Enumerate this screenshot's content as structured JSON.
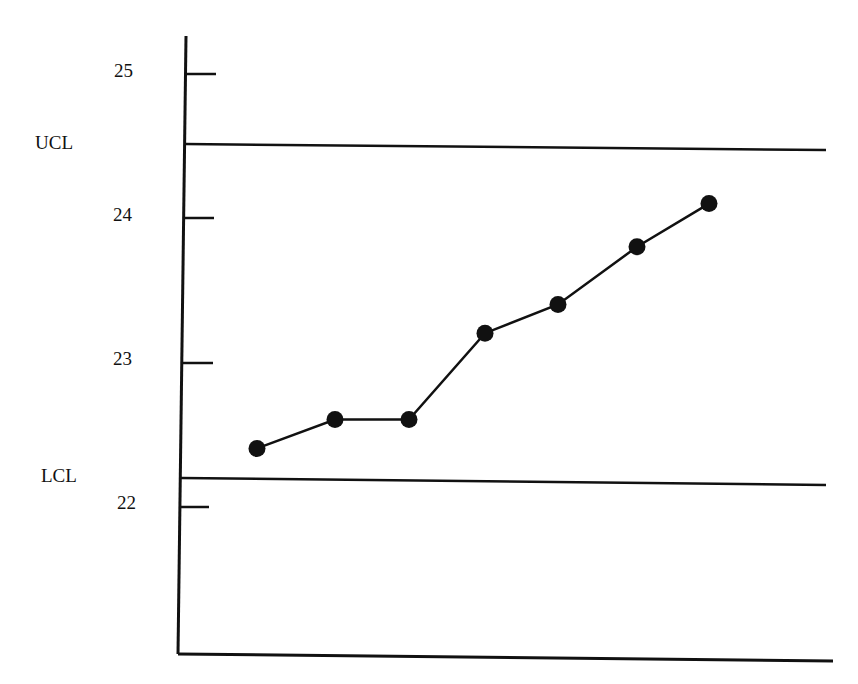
{
  "chart_data": {
    "type": "line",
    "title": "",
    "subtitle": "",
    "xlabel": "",
    "ylabel": "",
    "chart_kind": "control chart",
    "x": [
      1,
      2,
      3,
      4,
      5,
      6,
      7
    ],
    "series": [
      {
        "name": "Sample mean",
        "values": [
          22.4,
          22.6,
          22.6,
          23.2,
          23.4,
          23.8,
          24.1
        ],
        "marker": "filled-circle",
        "color": "#111111"
      }
    ],
    "control_limits": [
      {
        "label": "UCL",
        "value": 24.5
      },
      {
        "label": "LCL",
        "value": 22.2
      }
    ],
    "y_ticks": [
      {
        "label": "25",
        "value": 25
      },
      {
        "label": "24",
        "value": 24
      },
      {
        "label": "23",
        "value": 23
      },
      {
        "label": "22",
        "value": 22
      }
    ],
    "ylim": [
      21.0,
      25.25
    ],
    "grid": false,
    "legend": null
  },
  "labels": {
    "ucl": "UCL",
    "lcl": "LCL",
    "tick_25": "25",
    "tick_24": "24",
    "tick_23": "23",
    "tick_22": "22"
  }
}
